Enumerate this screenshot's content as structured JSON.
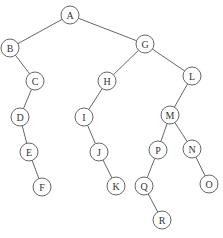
{
  "diagram": {
    "type": "binary-tree",
    "node_radius": 9,
    "colors": {
      "stroke": "#555555",
      "text": "#333333",
      "background": "#ffffff"
    },
    "nodes": [
      {
        "id": "A",
        "label": "A",
        "x": 70,
        "y": 15
      },
      {
        "id": "B",
        "label": "B",
        "x": 10,
        "y": 48
      },
      {
        "id": "G",
        "label": "G",
        "x": 145,
        "y": 44
      },
      {
        "id": "C",
        "label": "C",
        "x": 35,
        "y": 81
      },
      {
        "id": "D",
        "label": "D",
        "x": 20,
        "y": 117
      },
      {
        "id": "E",
        "label": "E",
        "x": 29,
        "y": 152
      },
      {
        "id": "F",
        "label": "F",
        "x": 42,
        "y": 187
      },
      {
        "id": "H",
        "label": "H",
        "x": 107,
        "y": 81
      },
      {
        "id": "I",
        "label": "I",
        "x": 84,
        "y": 117
      },
      {
        "id": "J",
        "label": "J",
        "x": 99,
        "y": 152
      },
      {
        "id": "K",
        "label": "K",
        "x": 116,
        "y": 186
      },
      {
        "id": "L",
        "label": "L",
        "x": 192,
        "y": 76
      },
      {
        "id": "M",
        "label": "M",
        "x": 170,
        "y": 115
      },
      {
        "id": "P",
        "label": "P",
        "x": 158,
        "y": 150
      },
      {
        "id": "N",
        "label": "N",
        "x": 192,
        "y": 149
      },
      {
        "id": "Q",
        "label": "Q",
        "x": 144,
        "y": 186
      },
      {
        "id": "O",
        "label": "O",
        "x": 209,
        "y": 184
      },
      {
        "id": "R",
        "label": "R",
        "x": 162,
        "y": 220
      }
    ],
    "edges": [
      [
        "A",
        "B"
      ],
      [
        "A",
        "G"
      ],
      [
        "B",
        "C"
      ],
      [
        "C",
        "D"
      ],
      [
        "D",
        "E"
      ],
      [
        "E",
        "F"
      ],
      [
        "G",
        "H"
      ],
      [
        "G",
        "L"
      ],
      [
        "H",
        "I"
      ],
      [
        "I",
        "J"
      ],
      [
        "J",
        "K"
      ],
      [
        "L",
        "M"
      ],
      [
        "M",
        "P"
      ],
      [
        "M",
        "N"
      ],
      [
        "P",
        "Q"
      ],
      [
        "Q",
        "R"
      ],
      [
        "N",
        "O"
      ]
    ]
  }
}
